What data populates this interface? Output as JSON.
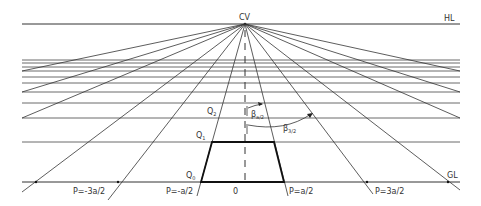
{
  "labels": {
    "cv": "CV",
    "hl": "HL",
    "gl": "GL",
    "q0": "Q",
    "q0_sub": "0",
    "q1": "Q",
    "q1_sub": "1",
    "q2": "Q",
    "q2_sub": "2",
    "beta_small": "β",
    "beta_small_sub": "a/2",
    "beta_large": "β",
    "beta_large_sub": "3/2",
    "p_neg_3a2": "P=-3a/2",
    "p_neg_a2": "P=-a/2",
    "origin": "0",
    "p_a2": "P=a/2",
    "p_3a2": "P=3a/2"
  },
  "geometry": {
    "cv": [
      245,
      24
    ],
    "hl_y": 24,
    "gl_y": 182,
    "x_left": 22,
    "x_right": 460,
    "horizontal_lines_y": [
      60,
      63,
      67,
      71,
      77,
      83,
      92,
      103,
      118,
      142
    ],
    "ground_crossings_x": [
      -130,
      -47,
      36,
      118,
      201,
      284,
      367,
      448,
      531,
      614
    ],
    "trapezoid": {
      "q0_y": 182,
      "q1_y": 142,
      "left_bottom": 201,
      "right_bottom": 284
    }
  },
  "colors": {
    "line": "#333333",
    "background": "#ffffff"
  }
}
